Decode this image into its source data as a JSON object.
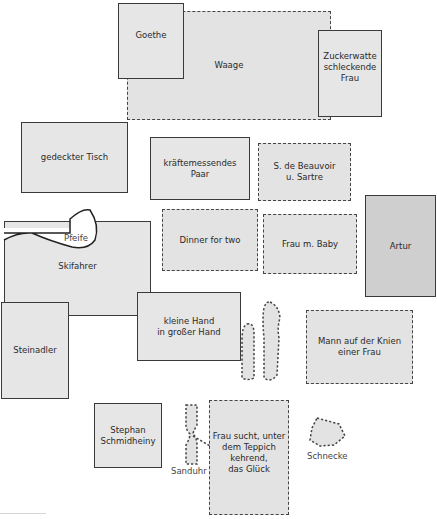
{
  "diagram": {
    "type": "spatial-arrangement",
    "legend": {
      "solid_border": "solid outline",
      "dashed_border": "dashed outline"
    },
    "items": [
      {
        "id": "goethe",
        "label": "Goethe",
        "border": "solid"
      },
      {
        "id": "waage",
        "label": "Waage",
        "border": "dashed"
      },
      {
        "id": "zuckerwatte",
        "label": "Zuckerwatte\nschleckende\nFrau",
        "border": "solid"
      },
      {
        "id": "gedeckter-tisch",
        "label": "gedeckter Tisch",
        "border": "solid"
      },
      {
        "id": "kraeftemessendes-paar",
        "label": "kräftemessendes\nPaar",
        "border": "solid"
      },
      {
        "id": "beauvoir-sartre",
        "label": "S. de Beauvoir\nu. Sartre",
        "border": "dashed"
      },
      {
        "id": "skifahrer",
        "label": "Skifahrer",
        "border": "solid"
      },
      {
        "id": "pfeife",
        "label": "Pfeife",
        "border": "solid-shape"
      },
      {
        "id": "dinner-for-two",
        "label": "Dinner for two",
        "border": "dashed"
      },
      {
        "id": "frau-m-baby",
        "label": "Frau m. Baby",
        "border": "dashed"
      },
      {
        "id": "artur",
        "label": "Artur",
        "border": "solid"
      },
      {
        "id": "steinadler",
        "label": "Steinadler",
        "border": "solid"
      },
      {
        "id": "kleine-hand",
        "label": "kleine Hand\nin großer Hand",
        "border": "solid"
      },
      {
        "id": "mann-auf-knien",
        "label": "Mann auf der Knien\neiner Frau",
        "border": "dashed"
      },
      {
        "id": "stephan-schmidheiny",
        "label": "Stephan\nSchmidheiny",
        "border": "solid"
      },
      {
        "id": "sanduhr",
        "label": "Sanduhr",
        "border": "dashed-shape"
      },
      {
        "id": "frau-sucht",
        "label": "Frau sucht, unter\ndem Teppich\nkehrend,\ndas Glück",
        "border": "dashed"
      },
      {
        "id": "schnecke",
        "label": "Schnecke",
        "border": "dashed-shape"
      }
    ]
  },
  "colors": {
    "box_fill": "#e6e6e6",
    "dark_fill": "#cfcfcf",
    "stroke": "#3a3a3a"
  }
}
